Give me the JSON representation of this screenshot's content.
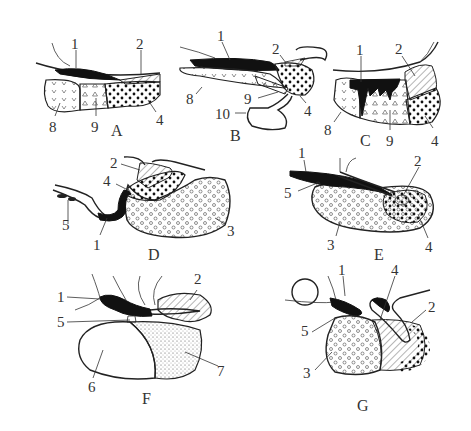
{
  "figure": {
    "type": "anatomical line diagram, seven panels",
    "panels": [
      {
        "id": "A",
        "label": "A",
        "callouts": [
          "1",
          "2",
          "8",
          "9",
          "4"
        ]
      },
      {
        "id": "B",
        "label": "B",
        "callouts": [
          "1",
          "2",
          "8",
          "9",
          "4",
          "10"
        ]
      },
      {
        "id": "C",
        "label": "C",
        "callouts": [
          "1",
          "2",
          "8",
          "9",
          "4"
        ]
      },
      {
        "id": "D",
        "label": "D",
        "callouts": [
          "2",
          "4",
          "5",
          "1",
          "3"
        ]
      },
      {
        "id": "E",
        "label": "E",
        "callouts": [
          "1",
          "2",
          "5",
          "3",
          "4"
        ]
      },
      {
        "id": "F",
        "label": "F",
        "callouts": [
          "1",
          "2",
          "5",
          "6",
          "7"
        ]
      },
      {
        "id": "G",
        "label": "G",
        "callouts": [
          "1",
          "4",
          "2",
          "5",
          "3"
        ]
      }
    ],
    "legend_patterns": {
      "1": "solid black",
      "2": "diagonal hatching",
      "3": "small open circles",
      "4": "large black dots",
      "5": "small tube/ring segment",
      "6": "blank (white)",
      "7": "fine stipple",
      "8": "V marks",
      "9": "small triangles",
      "10": "looped outline"
    },
    "colors": {
      "ink": "#222222",
      "background": "#ffffff"
    }
  }
}
